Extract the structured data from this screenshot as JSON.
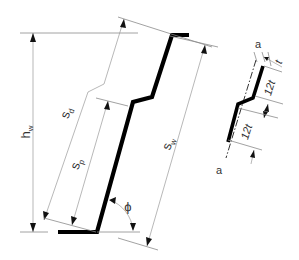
{
  "diagram": {
    "labels": {
      "hw_main": "h",
      "hw_sub": "w",
      "sd_main": "s",
      "sd_sub": "d",
      "sp_main": "s",
      "sp_sub": "p",
      "sw_main": "s",
      "sw_sub": "w",
      "phi": "ϕ",
      "a_top": "a",
      "t": "t",
      "twelve_t_upper": "12t",
      "twelve_t_lower": "12t",
      "a_bottom": "a"
    },
    "colors": {
      "profile": "#000000",
      "dimension_lines": "#9a9a9a",
      "text": "#333333"
    }
  }
}
